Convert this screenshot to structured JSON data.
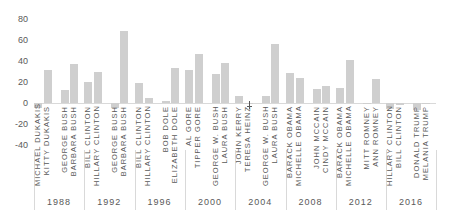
{
  "chart_data": {
    "type": "bar",
    "title": "",
    "xlabel": "",
    "ylabel": "",
    "ylim": [
      -40,
      80
    ],
    "yticks": [
      80,
      60,
      40,
      20,
      0,
      -20,
      -40
    ],
    "grid": false,
    "legend": null,
    "bar_color": "#cfcfcf",
    "text_color": "#595959",
    "groups": [
      {
        "year": "1988",
        "pairs": [
          {
            "label": [
              "MICHAEL DUKAKIS",
              "KITTY DUKAKIS"
            ],
            "values": [
              -5,
              31
            ]
          },
          {
            "label": [
              "GEORGE BUSH",
              "BARBARA BUSH"
            ],
            "values": [
              12,
              37
            ]
          }
        ]
      },
      {
        "year": "1992",
        "pairs": [
          {
            "label": [
              "BILL CLINTON",
              "HILLARY CLINTON"
            ],
            "values": [
              20,
              30
            ]
          },
          {
            "label": [
              "GEORGE BUSH",
              "BARBARA BUSH"
            ],
            "values": [
              -5,
              69
            ]
          }
        ]
      },
      {
        "year": "1996",
        "pairs": [
          {
            "label": [
              "BILL CLINTON",
              "HILLARY CLINTON"
            ],
            "values": [
              19,
              5
            ]
          },
          {
            "label": [
              "BOB DOLE",
              "ELIZABETH DOLE"
            ],
            "values": [
              2,
              33
            ]
          }
        ]
      },
      {
        "year": "2000",
        "pairs": [
          {
            "label": [
              "AL GORE",
              "TIPPER GORE"
            ],
            "values": [
              31,
              47
            ]
          },
          {
            "label": [
              "GEORGE W. BUSH",
              "LAURA BUSH"
            ],
            "values": [
              28,
              38
            ]
          }
        ]
      },
      {
        "year": "2004",
        "pairs": [
          {
            "label": [
              "JOHN KERRY",
              "TERESA HEINZ"
            ],
            "values": [
              7,
              -1
            ]
          },
          {
            "label": [
              "GEORGE W. BUSH",
              "LAURA BUSH"
            ],
            "values": [
              7,
              56
            ]
          }
        ]
      },
      {
        "year": "2008",
        "pairs": [
          {
            "label": [
              "BARACK OBAMA",
              "MICHELLE OBAMA"
            ],
            "values": [
              29,
              24
            ]
          },
          {
            "label": [
              "JOHN MCCAIN",
              "CINDY MCCAIN"
            ],
            "values": [
              13,
              16
            ]
          }
        ]
      },
      {
        "year": "2012",
        "pairs": [
          {
            "label": [
              "BARACK OBAMA",
              "MICHELLE OBAMA"
            ],
            "values": [
              14,
              41
            ]
          },
          {
            "label": [
              "MITT ROMNEY",
              "ANN ROMNEY"
            ],
            "values": [
              -1,
              23
            ]
          }
        ]
      },
      {
        "year": "2016",
        "pairs": [
          {
            "label": [
              "HILLARY CLINTON",
              "BILL CLINTON"
            ],
            "values": [
              -6,
              -2
            ]
          },
          {
            "label": [
              "DONALD TRUMP",
              "MELANIA TRUMP"
            ],
            "values": [
              -7,
              -1
            ]
          }
        ]
      }
    ]
  }
}
